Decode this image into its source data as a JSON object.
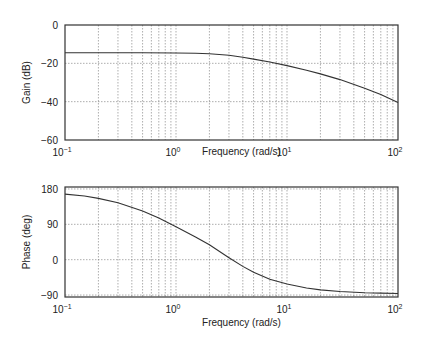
{
  "chart_data": [
    {
      "type": "line",
      "name": "gain",
      "xscale": "log",
      "xlim": [
        0.1,
        100
      ],
      "ylim": [
        -60,
        0
      ],
      "xlabel": "Frequency (rad/s)",
      "ylabel": "Gain (dB)",
      "x_ticks": [
        {
          "base": "10",
          "exp": "−1",
          "value": 0.1
        },
        {
          "base": "10",
          "exp": "0",
          "value": 1
        },
        {
          "base": "10",
          "exp": "1",
          "value": 10
        },
        {
          "base": "10",
          "exp": "2",
          "value": 100
        }
      ],
      "y_ticks": [
        0,
        -20,
        -40,
        -60
      ],
      "grid": true,
      "series": [
        {
          "name": "gain",
          "x": [
            0.1,
            0.2,
            0.5,
            1,
            1.5,
            2,
            3,
            4,
            5,
            7,
            10,
            15,
            20,
            30,
            50,
            70,
            100
          ],
          "y": [
            -14.5,
            -14.5,
            -14.5,
            -14.6,
            -14.7,
            -15.0,
            -15.8,
            -16.8,
            -17.8,
            -19.3,
            -21.2,
            -23.6,
            -25.5,
            -28.5,
            -33.0,
            -36.3,
            -40.5
          ]
        }
      ]
    },
    {
      "type": "line",
      "name": "phase",
      "xscale": "log",
      "xlim": [
        0.1,
        100
      ],
      "ylim": [
        -95,
        185
      ],
      "xlabel": "Frequency (rad/s)",
      "ylabel": "Phase (deg)",
      "x_ticks": [
        {
          "base": "10",
          "exp": "−1",
          "value": 0.1
        },
        {
          "base": "10",
          "exp": "0",
          "value": 1
        },
        {
          "base": "10",
          "exp": "1",
          "value": 10
        },
        {
          "base": "10",
          "exp": "2",
          "value": 100
        }
      ],
      "y_ticks": [
        180,
        90,
        0,
        -90
      ],
      "grid": true,
      "series": [
        {
          "name": "phase",
          "x": [
            0.1,
            0.15,
            0.2,
            0.3,
            0.5,
            0.7,
            1,
            1.5,
            2,
            3,
            4,
            5,
            7,
            10,
            15,
            20,
            30,
            50,
            70,
            100
          ],
          "y": [
            167,
            162,
            156,
            145,
            124,
            106,
            84,
            58,
            38,
            5,
            -17,
            -32,
            -50,
            -62,
            -72,
            -77,
            -81,
            -84,
            -85,
            -86
          ]
        }
      ]
    }
  ]
}
